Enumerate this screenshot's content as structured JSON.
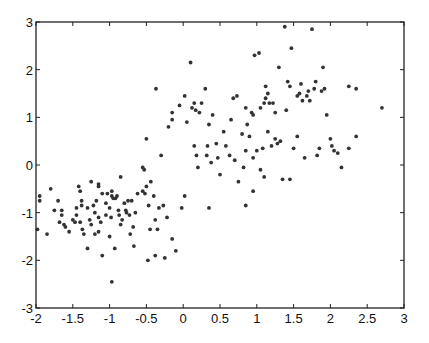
{
  "chart_data": {
    "type": "scatter",
    "title": "",
    "xlabel": "",
    "ylabel": "",
    "xlim": [
      -2,
      3
    ],
    "ylim": [
      -3,
      3
    ],
    "grid": false,
    "legend": null,
    "x_ticks": [
      "-2",
      "-1.5",
      "-1",
      "-0.5",
      "0",
      "0.5",
      "1",
      "1.5",
      "2",
      "2.5",
      "3"
    ],
    "y_ticks": [
      "-3",
      "-2",
      "-1",
      "0",
      "1",
      "2",
      "3"
    ],
    "marker_color": "#333333",
    "series": [
      {
        "name": "cluster-1",
        "points": [
          [
            -1.95,
            -0.65
          ],
          [
            -1.95,
            -0.75
          ],
          [
            -1.98,
            -1.35
          ],
          [
            -1.85,
            -1.45
          ],
          [
            -1.8,
            -0.5
          ],
          [
            -1.7,
            -0.75
          ],
          [
            -1.65,
            -0.95
          ],
          [
            -1.65,
            -1.05
          ],
          [
            -1.68,
            -1.2
          ],
          [
            -1.62,
            -1.25
          ],
          [
            -1.6,
            -1.3
          ],
          [
            -1.55,
            -1.4
          ],
          [
            -1.5,
            -1.15
          ],
          [
            -1.47,
            -1.2
          ],
          [
            -1.45,
            -0.9
          ],
          [
            -1.45,
            -1.05
          ],
          [
            -1.42,
            -0.45
          ],
          [
            -1.4,
            -0.55
          ],
          [
            -1.4,
            -1.2
          ],
          [
            -1.38,
            -0.75
          ],
          [
            -1.38,
            -0.85
          ],
          [
            -1.37,
            -1.35
          ],
          [
            -1.35,
            -1.45
          ],
          [
            -1.3,
            -0.9
          ],
          [
            -1.3,
            -1.75
          ],
          [
            -1.27,
            -1.15
          ],
          [
            -1.25,
            -1.25
          ],
          [
            -1.25,
            -0.35
          ],
          [
            -1.22,
            -0.85
          ],
          [
            -1.2,
            -1.0
          ],
          [
            -1.2,
            -1.45
          ],
          [
            -1.18,
            -0.75
          ],
          [
            -1.15,
            -0.4
          ],
          [
            -1.15,
            -0.45
          ],
          [
            -1.15,
            -1.1
          ],
          [
            -1.15,
            -1.4
          ],
          [
            -1.12,
            -1.2
          ],
          [
            -1.1,
            -0.6
          ],
          [
            -1.1,
            -1.9
          ],
          [
            -1.05,
            -0.8
          ],
          [
            -1.05,
            -1.05
          ],
          [
            -1.03,
            -0.6
          ],
          [
            -1.0,
            -0.9
          ],
          [
            -1.0,
            -1.5
          ],
          [
            -0.98,
            -1.1
          ],
          [
            -0.97,
            -0.55
          ],
          [
            -0.97,
            -0.65
          ],
          [
            -0.95,
            -0.7
          ],
          [
            -0.93,
            -1.75
          ],
          [
            -0.92,
            -0.7
          ],
          [
            -0.9,
            -0.65
          ],
          [
            -0.88,
            -0.95
          ],
          [
            -0.87,
            -1.05
          ],
          [
            -0.85,
            -1.25
          ],
          [
            -0.85,
            -0.25
          ],
          [
            -0.83,
            -1.15
          ],
          [
            -0.8,
            -0.8
          ],
          [
            -0.78,
            -0.95
          ],
          [
            -0.77,
            -1.0
          ],
          [
            -0.75,
            -0.75
          ],
          [
            -0.73,
            -1.05
          ],
          [
            -0.72,
            -1.45
          ],
          [
            -0.7,
            -0.75
          ],
          [
            -0.68,
            -1.3
          ],
          [
            -0.67,
            -1.7
          ],
          [
            -0.65,
            -1.0
          ],
          [
            -0.62,
            -0.6
          ],
          [
            -0.55,
            -0.55
          ],
          [
            -0.52,
            -0.6
          ],
          [
            -0.5,
            -0.45
          ],
          [
            -0.48,
            -2.0
          ],
          [
            -0.47,
            -0.85
          ],
          [
            -0.45,
            -1.35
          ],
          [
            -0.44,
            -0.35
          ],
          [
            -0.4,
            -0.65
          ],
          [
            -0.38,
            -1.15
          ],
          [
            -0.38,
            -1.9
          ],
          [
            -0.35,
            -1.35
          ],
          [
            -0.33,
            -0.9
          ],
          [
            -0.27,
            -0.85
          ],
          [
            -0.25,
            -1.95
          ],
          [
            -0.22,
            -1.1
          ],
          [
            -0.15,
            -1.55
          ],
          [
            -0.1,
            -1.8
          ],
          [
            -0.02,
            -0.9
          ],
          [
            0.02,
            -0.65
          ],
          [
            0.35,
            -0.9
          ],
          [
            -0.97,
            -2.45
          ],
          [
            -0.55,
            -0.05
          ],
          [
            -0.53,
            -0.1
          ],
          [
            -1.75,
            -0.95
          ]
        ]
      },
      {
        "name": "cluster-2",
        "points": [
          [
            -0.5,
            0.55
          ],
          [
            -0.37,
            1.6
          ],
          [
            -0.3,
            0.2
          ],
          [
            -0.2,
            0.8
          ],
          [
            -0.15,
            1.1
          ],
          [
            -0.15,
            0.95
          ],
          [
            -0.05,
            1.25
          ],
          [
            0.02,
            1.45
          ],
          [
            0.05,
            0.9
          ],
          [
            0.1,
            2.15
          ],
          [
            0.12,
            1.2
          ],
          [
            0.15,
            1.3
          ],
          [
            0.15,
            0.4
          ],
          [
            0.17,
            1.15
          ],
          [
            0.18,
            0.2
          ],
          [
            0.2,
            -0.05
          ],
          [
            0.22,
            1.1
          ],
          [
            0.25,
            1.3
          ],
          [
            0.3,
            1.6
          ],
          [
            0.32,
            0.2
          ],
          [
            0.33,
            0.4
          ],
          [
            0.35,
            0.85
          ],
          [
            0.38,
            0.05
          ],
          [
            0.4,
            1.05
          ],
          [
            0.45,
            0.45
          ],
          [
            0.47,
            0.15
          ],
          [
            0.5,
            -0.2
          ],
          [
            0.55,
            0.7
          ],
          [
            0.58,
            0.4
          ],
          [
            0.63,
            0.2
          ],
          [
            0.65,
            0.95
          ],
          [
            0.68,
            1.4
          ],
          [
            0.7,
            0.1
          ],
          [
            0.73,
            1.45
          ],
          [
            0.75,
            -0.35
          ],
          [
            0.8,
            0.65
          ],
          [
            0.82,
            -0.05
          ],
          [
            0.85,
            1.2
          ],
          [
            0.85,
            0.3
          ],
          [
            0.87,
            0.85
          ],
          [
            0.9,
            0.6
          ],
          [
            0.93,
            1.1
          ],
          [
            0.95,
            1.05
          ],
          [
            0.95,
            0.15
          ],
          [
            0.97,
            2.3
          ],
          [
            1.0,
            0.3
          ],
          [
            1.03,
            2.35
          ],
          [
            1.05,
            1.2
          ],
          [
            1.05,
            -0.1
          ],
          [
            1.08,
            0.35
          ],
          [
            1.1,
            1.3
          ],
          [
            1.12,
            1.65
          ],
          [
            1.12,
            1.4
          ],
          [
            1.15,
            1.5
          ],
          [
            1.15,
            0.7
          ],
          [
            1.17,
            1.3
          ],
          [
            1.2,
            0.4
          ],
          [
            1.22,
            1.3
          ],
          [
            1.25,
            1.1
          ],
          [
            1.25,
            0.55
          ],
          [
            1.28,
            0.45
          ],
          [
            1.3,
            2.05
          ],
          [
            1.32,
            0.5
          ],
          [
            1.38,
            2.9
          ],
          [
            1.4,
            1.15
          ],
          [
            1.42,
            1.75
          ],
          [
            1.45,
            1.65
          ],
          [
            1.47,
            2.45
          ],
          [
            1.5,
            0.35
          ],
          [
            1.55,
            1.45
          ],
          [
            1.55,
            0.6
          ],
          [
            1.58,
            1.5
          ],
          [
            1.6,
            1.7
          ],
          [
            1.62,
            1.35
          ],
          [
            1.65,
            0.15
          ],
          [
            1.68,
            1.45
          ],
          [
            1.7,
            1.55
          ],
          [
            1.72,
            1.35
          ],
          [
            1.75,
            2.85
          ],
          [
            1.78,
            1.6
          ],
          [
            1.8,
            1.75
          ],
          [
            1.82,
            0.2
          ],
          [
            1.85,
            0.35
          ],
          [
            1.88,
            1.55
          ],
          [
            1.9,
            2.05
          ],
          [
            1.92,
            1.6
          ],
          [
            1.95,
            1.05
          ],
          [
            2.0,
            0.55
          ],
          [
            2.02,
            0.4
          ],
          [
            2.05,
            0.3
          ],
          [
            2.1,
            0.25
          ],
          [
            2.15,
            -0.05
          ],
          [
            2.25,
            1.65
          ],
          [
            2.35,
            1.6
          ],
          [
            2.35,
            0.6
          ],
          [
            2.25,
            0.35
          ],
          [
            2.7,
            1.2
          ],
          [
            1.45,
            -0.3
          ],
          [
            1.1,
            -0.25
          ],
          [
            0.95,
            -0.55
          ],
          [
            0.85,
            -0.85
          ],
          [
            1.35,
            -0.3
          ]
        ]
      }
    ]
  }
}
